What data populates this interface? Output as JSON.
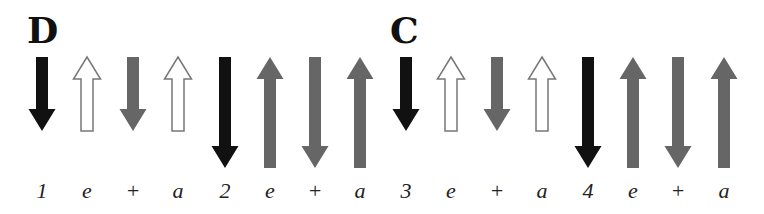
{
  "colors": {
    "strong_down": "#111111",
    "medium": "#666666",
    "ghost_outline": "#777777",
    "ghost_fill": "#ffffff",
    "text": "#222222"
  },
  "chords": [
    {
      "label": "D",
      "x": 27
    },
    {
      "label": "C",
      "x": 390
    }
  ],
  "beats": [
    {
      "count": "1",
      "x": 42,
      "direction": "down",
      "style": "strong",
      "length": "short"
    },
    {
      "count": "e",
      "x": 87,
      "direction": "up",
      "style": "ghost",
      "length": "short"
    },
    {
      "count": "+",
      "x": 133,
      "direction": "down",
      "style": "medium",
      "length": "short"
    },
    {
      "count": "a",
      "x": 178,
      "direction": "up",
      "style": "ghost",
      "length": "short"
    },
    {
      "count": "2",
      "x": 225,
      "direction": "down",
      "style": "strong",
      "length": "long"
    },
    {
      "count": "e",
      "x": 270,
      "direction": "up",
      "style": "medium",
      "length": "long"
    },
    {
      "count": "+",
      "x": 315,
      "direction": "down",
      "style": "medium",
      "length": "long"
    },
    {
      "count": "a",
      "x": 360,
      "direction": "up",
      "style": "medium",
      "length": "long"
    },
    {
      "count": "3",
      "x": 406,
      "direction": "down",
      "style": "strong",
      "length": "short"
    },
    {
      "count": "e",
      "x": 451,
      "direction": "up",
      "style": "ghost",
      "length": "short"
    },
    {
      "count": "+",
      "x": 497,
      "direction": "down",
      "style": "medium",
      "length": "short"
    },
    {
      "count": "a",
      "x": 542,
      "direction": "up",
      "style": "ghost",
      "length": "short"
    },
    {
      "count": "4",
      "x": 588,
      "direction": "down",
      "style": "strong",
      "length": "long"
    },
    {
      "count": "e",
      "x": 633,
      "direction": "up",
      "style": "medium",
      "length": "long"
    },
    {
      "count": "+",
      "x": 678,
      "direction": "down",
      "style": "medium",
      "length": "long"
    },
    {
      "count": "a",
      "x": 724,
      "direction": "up",
      "style": "medium",
      "length": "long"
    }
  ]
}
